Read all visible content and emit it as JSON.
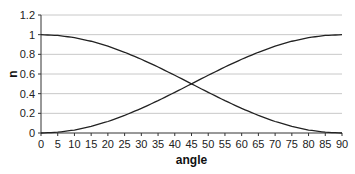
{
  "chart_data": {
    "type": "line",
    "title": "",
    "xlabel": "angle",
    "ylabel": "n",
    "xlim": [
      0,
      90
    ],
    "ylim": [
      0,
      1.2
    ],
    "grid": true,
    "legend": null,
    "x_ticks": [
      "0",
      "5",
      "10",
      "15",
      "20",
      "25",
      "30",
      "35",
      "40",
      "45",
      "50",
      "55",
      "60",
      "65",
      "70",
      "75",
      "80",
      "85",
      "90"
    ],
    "y_ticks": [
      "0",
      "0.2",
      "0.4",
      "0.6",
      "0.8",
      "1",
      "1.2"
    ],
    "x": [
      0,
      5,
      10,
      15,
      20,
      25,
      30,
      35,
      40,
      45,
      50,
      55,
      60,
      65,
      70,
      75,
      80,
      85,
      90
    ],
    "series": [
      {
        "name": "cos^2",
        "values": [
          1,
          0.992,
          0.97,
          0.933,
          0.883,
          0.821,
          0.75,
          0.671,
          0.587,
          0.5,
          0.413,
          0.329,
          0.25,
          0.179,
          0.117,
          0.067,
          0.03,
          0.008,
          0
        ]
      },
      {
        "name": "sin^2",
        "values": [
          0,
          0.008,
          0.03,
          0.067,
          0.117,
          0.179,
          0.25,
          0.329,
          0.413,
          0.5,
          0.587,
          0.671,
          0.75,
          0.821,
          0.883,
          0.933,
          0.97,
          0.992,
          1
        ]
      }
    ]
  }
}
